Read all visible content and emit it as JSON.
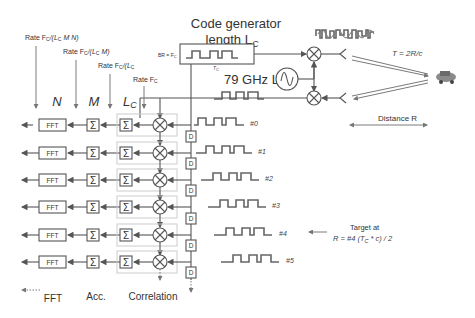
{
  "title": {
    "line1": "Code generator",
    "line2": "length L",
    "line2_sub": "C"
  },
  "code_generator": {
    "bit_rate_label": "BR = F",
    "bit_rate_sub": "C",
    "chip_label": "T",
    "chip_sub": "C"
  },
  "lo": {
    "label": "79 GHz LO"
  },
  "propagation": {
    "delay_label": "T = 2R/c",
    "distance_label": "Distance R"
  },
  "rates": [
    {
      "prefix": "Rate F",
      "sub": "C",
      "suffix": "/(L",
      "sub2": "C",
      "tail": " M N)"
    },
    {
      "prefix": "Rate F",
      "sub": "C",
      "suffix": "/(L",
      "sub2": "C",
      "tail": " M)"
    },
    {
      "prefix": "Rate F",
      "sub": "C",
      "suffix": "/(L",
      "sub2": "C",
      "tail": ""
    },
    {
      "prefix": "Rate F",
      "sub": "C",
      "suffix": "",
      "sub2": "",
      "tail": ""
    }
  ],
  "stage_headers": {
    "n": "N",
    "m": "M",
    "lc": "L",
    "lc_sub": "C"
  },
  "blocks": {
    "fft": "FFT",
    "sum": "Σ",
    "delay": "D"
  },
  "taps": [
    {
      "label": "#0"
    },
    {
      "label": "#1"
    },
    {
      "label": "#2"
    },
    {
      "label": "#3"
    },
    {
      "label": "#4"
    },
    {
      "label": "#5"
    }
  ],
  "target": {
    "line1": "Target at",
    "line2": "R = #4 (T",
    "line2_sub": "C",
    "line2_tail": " * c) / 2"
  },
  "footer": {
    "fft": "FFT",
    "acc": "Acc.",
    "correlation": "Correlation"
  },
  "colors": {
    "line": "#555555",
    "text": "#333333",
    "group_box": "#cccccc"
  }
}
